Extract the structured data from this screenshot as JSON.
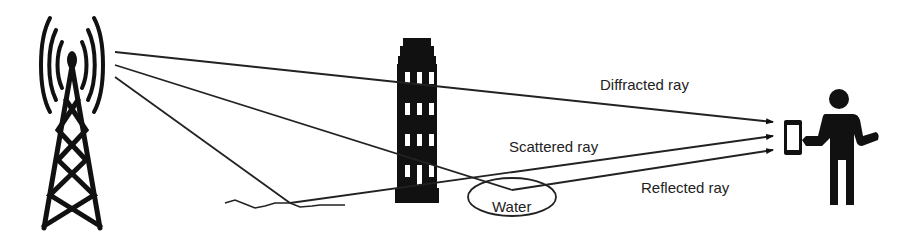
{
  "diagram": {
    "colors": {
      "ink": "#111111",
      "line": "#222222",
      "background": "#ffffff"
    },
    "elements": {
      "transmitter": "cell-tower-icon",
      "obstacle": "building-icon",
      "receiver": "person-with-phone-icon",
      "ground": "rough-ground-surface",
      "water": "water-ellipse"
    },
    "labels": {
      "diffracted": "Diffracted ray",
      "scattered": "Scattered ray",
      "reflected": "Reflected ray",
      "water": "Water"
    },
    "rays": [
      {
        "name": "diffracted",
        "points": [
          [
            115,
            52
          ],
          [
            400,
            74
          ],
          [
            773,
            122
          ]
        ]
      },
      {
        "name": "scattered",
        "points": [
          [
            115,
            77
          ],
          [
            290,
            203
          ],
          [
            773,
            136
          ]
        ]
      },
      {
        "name": "reflected",
        "points": [
          [
            115,
            65
          ],
          [
            512,
            190
          ],
          [
            773,
            150
          ]
        ]
      }
    ]
  }
}
